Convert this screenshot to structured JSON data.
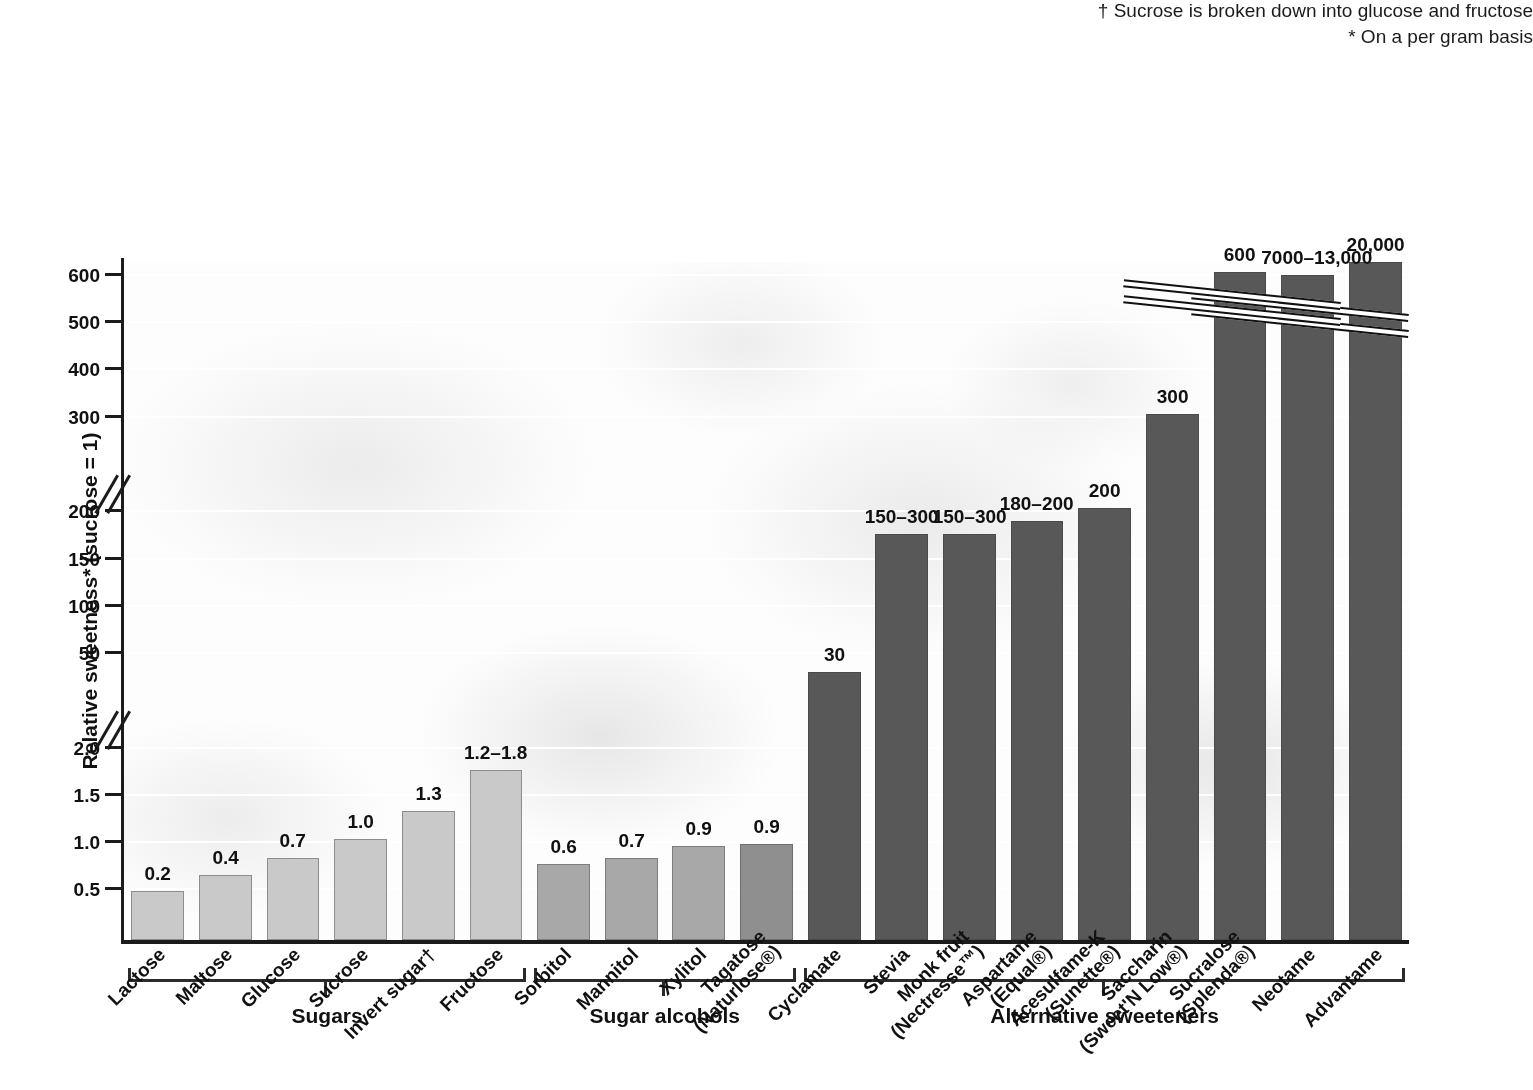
{
  "chart": {
    "type": "bar",
    "axis_title": "Relative sweetness* (sucrose = 1)",
    "footnotes": [
      "* On a per gram basis",
      "† Sucrose is broken down into glucose and fructose"
    ],
    "groups": [
      {
        "label": "Sugars"
      },
      {
        "label": "Sugar alcohols"
      },
      {
        "label": "Alternative sweeteners"
      }
    ],
    "axis_ticks": [
      "0.5",
      "1.0",
      "1.5",
      "2.0",
      "50",
      "100",
      "150",
      "200",
      "300",
      "400",
      "500",
      "600"
    ]
  },
  "chart_data": {
    "type": "bar",
    "title": "",
    "xlabel": "",
    "ylabel": "Relative sweetness* (sucrose = 1)",
    "orientation": "vertical",
    "grid": true,
    "legend": "none",
    "axis_breaks": [
      [
        2.0,
        50
      ],
      [
        200,
        300
      ]
    ],
    "ylim": [
      0,
      600
    ],
    "categories": [
      "Lactose",
      "Maltose",
      "Glucose",
      "Sucrose",
      "Invert sugar†",
      "Fructose",
      "Sorbitol",
      "Mannitol",
      "Xylitol",
      "Tagatose (Naturlose®)",
      "Cyclamate",
      "Stevia",
      "Monk fruit (Nectresse™)",
      "Aspartame (Equal®)",
      "Acesulfame-K (Sunette®)",
      "Saccharin (Sweet'N Low®)",
      "Sucralose (Splenda®)",
      "Neotame",
      "Advantame"
    ],
    "values": [
      0.2,
      0.4,
      0.7,
      1.0,
      1.3,
      1.5,
      0.6,
      0.7,
      0.9,
      0.9,
      30,
      225,
      225,
      190,
      200,
      300,
      600,
      10000,
      20000
    ],
    "value_labels": [
      "0.2",
      "0.4",
      "0.7",
      "1.0",
      "1.3",
      "1.2–1.8",
      "0.6",
      "0.7",
      "0.9",
      "0.9",
      "30",
      "150–300",
      "150–300",
      "180–200",
      "200",
      "300",
      "600",
      "7000–13,000",
      "20,000"
    ],
    "group_of": [
      "Sugars",
      "Sugars",
      "Sugars",
      "Sugars",
      "Sugars",
      "Sugars",
      "Sugar alcohols",
      "Sugar alcohols",
      "Sugar alcohols",
      "Sugar alcohols",
      "Alternative sweeteners",
      "Alternative sweeteners",
      "Alternative sweeteners",
      "Alternative sweeteners",
      "Alternative sweeteners",
      "Alternative sweeteners",
      "Alternative sweeteners",
      "Alternative sweeteners",
      "Alternative sweeteners"
    ],
    "colors": {
      "sugars": "#c9c9c9",
      "sugar_alcohols": "#a8a8a8",
      "alternative_sweeteners": "#585858",
      "axis": "#1b1b1b",
      "gridline": "#ffffff"
    }
  },
  "cats": [
    {
      "name": "Advantame",
      "value_label": "20,000",
      "cls": "alt",
      "lines": [
        "Advantame"
      ]
    },
    {
      "name": "Neotame",
      "value_label": "7000–13,000",
      "cls": "alt",
      "lines": [
        "Neotame"
      ]
    },
    {
      "name": "Sucralose (Splenda®)",
      "value_label": "600",
      "cls": "alt",
      "lines": [
        "Sucralose",
        "(Splenda®)"
      ]
    },
    {
      "name": "Saccharin (Sweet'N Low®)",
      "value_label": "300",
      "cls": "alt",
      "lines": [
        "Saccharin",
        "(Sweet'N Low®)"
      ]
    },
    {
      "name": "Acesulfame-K (Sunette®)",
      "value_label": "200",
      "cls": "alt",
      "lines": [
        "Acesulfame-K",
        "(Sunette®)"
      ]
    },
    {
      "name": "Aspartame (Equal®)",
      "value_label": "180–200",
      "cls": "alt",
      "lines": [
        "Aspartame",
        "(Equal®)"
      ]
    },
    {
      "name": "Monk fruit (Nectresse™)",
      "value_label": "150–300",
      "cls": "alt",
      "lines": [
        "Monk fruit",
        "(Nectresse™)"
      ]
    },
    {
      "name": "Stevia",
      "value_label": "150–300",
      "cls": "alt",
      "lines": [
        "Stevia"
      ]
    },
    {
      "name": "Cyclamate",
      "value_label": "30",
      "cls": "alt",
      "lines": [
        "Cyclamate"
      ]
    },
    {
      "name": "Tagatose (Naturlose®)",
      "value_label": "0.9",
      "cls": "alcohol dark",
      "lines": [
        "Tagatose",
        "(Naturlose®)"
      ]
    },
    {
      "name": "Xylitol",
      "value_label": "0.9",
      "cls": "alcohol",
      "lines": [
        "Xylitol"
      ]
    },
    {
      "name": "Mannitol",
      "value_label": "0.7",
      "cls": "alcohol",
      "lines": [
        "Mannitol"
      ]
    },
    {
      "name": "Sorbitol",
      "value_label": "0.6",
      "cls": "alcohol",
      "lines": [
        "Sorbitol"
      ]
    },
    {
      "name": "Fructose",
      "value_label": "1.2–1.8",
      "cls": "sugar",
      "lines": [
        "Fructose"
      ]
    },
    {
      "name": "Invert sugar†",
      "value_label": "1.3",
      "cls": "sugar",
      "lines": [
        "Invert sugar†"
      ]
    },
    {
      "name": "Sucrose",
      "value_label": "1.0",
      "cls": "sugar",
      "lines": [
        "Sucrose"
      ]
    },
    {
      "name": "Glucose",
      "value_label": "0.7",
      "cls": "sugar",
      "lines": [
        "Glucose"
      ]
    },
    {
      "name": "Maltose",
      "value_label": "0.4",
      "cls": "sugar",
      "lines": [
        "Maltose"
      ]
    },
    {
      "name": "Lactose",
      "value_label": "0.2",
      "cls": "sugar",
      "lines": [
        "Lactose"
      ]
    }
  ]
}
